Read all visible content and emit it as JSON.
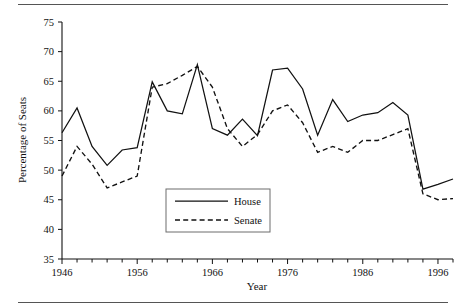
{
  "chart_data": {
    "type": "line",
    "title": "",
    "xlabel": "Year",
    "ylabel": "Percentage of Seats",
    "xlim": [
      1946,
      1998
    ],
    "ylim": [
      35,
      75
    ],
    "ytick_step": 5,
    "yticks": [
      35,
      40,
      45,
      50,
      55,
      60,
      65,
      70,
      75
    ],
    "ytick_labels": [
      "35",
      "40",
      "45",
      "50",
      "55",
      "60",
      "65",
      "70",
      "75"
    ],
    "xticks": [
      1946,
      1948,
      1950,
      1952,
      1954,
      1956,
      1958,
      1960,
      1962,
      1964,
      1966,
      1968,
      1970,
      1972,
      1974,
      1976,
      1978,
      1980,
      1982,
      1984,
      1986,
      1988,
      1990,
      1992,
      1994,
      1996,
      1998
    ],
    "xtick_labels_shown": [
      "1946",
      "1956",
      "1966",
      "1976",
      "1986",
      "1996"
    ],
    "xtick_labels_shown_values": [
      1946,
      1956,
      1966,
      1976,
      1986,
      1996
    ],
    "grid": false,
    "legend_position": "lower-center",
    "x": [
      1946,
      1948,
      1950,
      1952,
      1954,
      1956,
      1958,
      1960,
      1962,
      1964,
      1966,
      1968,
      1970,
      1972,
      1974,
      1976,
      1978,
      1980,
      1982,
      1984,
      1986,
      1988,
      1990,
      1992,
      1994,
      1996,
      1998
    ],
    "series": [
      {
        "name": "House",
        "style": "solid",
        "values": [
          56.3,
          60.5,
          54.0,
          50.8,
          53.4,
          53.8,
          64.9,
          60.0,
          59.5,
          67.8,
          57.0,
          55.9,
          58.6,
          55.8,
          66.9,
          67.2,
          63.7,
          55.9,
          61.9,
          58.2,
          59.3,
          59.7,
          61.4,
          59.3,
          46.8,
          47.6,
          48.5
        ]
      },
      {
        "name": "Senate",
        "style": "dashed",
        "values": [
          49.0,
          54.0,
          51.0,
          47.0,
          48.0,
          49.0,
          64.0,
          64.6,
          66.0,
          67.5,
          64.0,
          57.0,
          54.0,
          56.0,
          60.0,
          61.0,
          58.0,
          53.0,
          54.0,
          53.0,
          55.0,
          55.0,
          56.0,
          57.0,
          46.0,
          45.0,
          45.2
        ]
      }
    ],
    "legend": [
      {
        "label": "House",
        "style": "solid"
      },
      {
        "label": "Senate",
        "style": "dashed"
      }
    ]
  },
  "colors": {
    "ink": "#111111",
    "rule": "#555555",
    "legend_border": "#6d6d6d",
    "background": "#ffffff"
  }
}
